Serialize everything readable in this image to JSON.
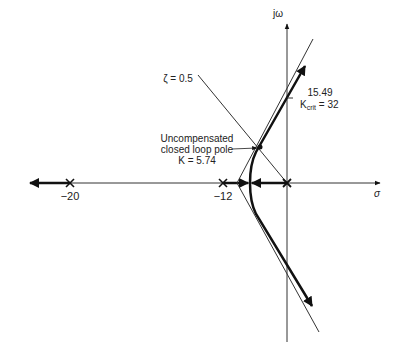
{
  "diagram": {
    "type": "root-locus",
    "axes": {
      "real_axis_label": "σ",
      "imag_axis_label": "jω"
    },
    "poles": [
      {
        "label": "−20",
        "value": -20
      },
      {
        "label": "−12",
        "value": -12
      },
      {
        "label": "",
        "value": 0
      }
    ],
    "annotations": {
      "damping_line": "ζ = 0.5",
      "pole_label_line1": "Uncompensated",
      "pole_label_line2": "closed loop pole",
      "pole_label_line3": "K = 5.74",
      "crossing_value": "15.49",
      "k_crit_prefix": "K",
      "k_crit_sub": "crit",
      "k_crit_value": " = 32"
    }
  }
}
